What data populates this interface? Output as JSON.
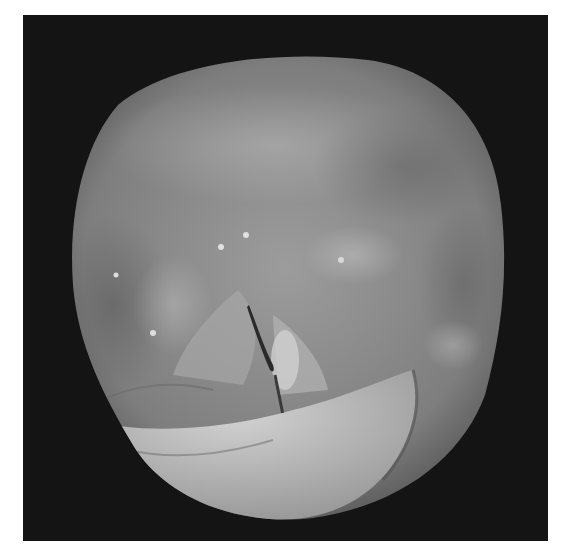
{
  "image": {
    "kind": "endoscopic laryngoscopy photograph",
    "color_mode": "grayscale",
    "description": "Circular endoscopic view of the larynx showing the glottis (vocal fold slit) centrally, surrounding mucosal folds, and a pale curved structure along the lower edge",
    "colors": {
      "background": "#ffffff",
      "frame": "#141414",
      "tissue_mid": "#8a8a8a",
      "tissue_light": "#c4c4c4",
      "tissue_dark": "#4a4a4a",
      "glottis_slit": "#2a2a2a"
    }
  }
}
